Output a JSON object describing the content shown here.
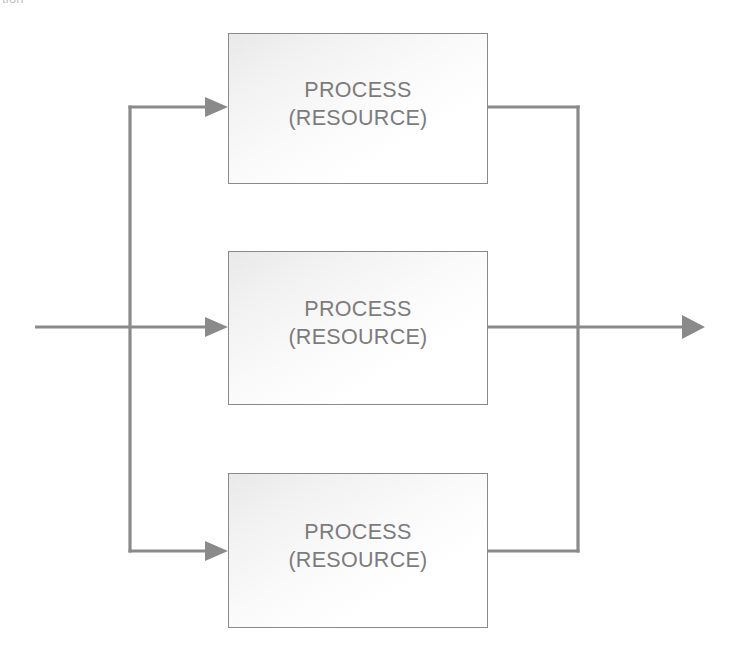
{
  "diagram": {
    "title_fragment": "tion",
    "type": "parallel-process-flow",
    "line_color": "#8a8a8a",
    "text_color": "#7c7c7c",
    "arrow_color": "#8a8a8a",
    "background": "#ffffff",
    "boxes": [
      {
        "id": "box-1",
        "line1": "PROCESS",
        "line2": "(RESOURCE)"
      },
      {
        "id": "box-2",
        "line1": "PROCESS",
        "line2": "(RESOURCE)"
      },
      {
        "id": "box-3",
        "line1": "PROCESS",
        "line2": "(RESOURCE)"
      }
    ],
    "connectors": {
      "input_label": "",
      "output_label": "",
      "split_x": 130,
      "merge_x": 578,
      "input_start_x": 35,
      "output_end_x": 705,
      "branch_y": [
        107,
        327,
        551
      ]
    }
  }
}
